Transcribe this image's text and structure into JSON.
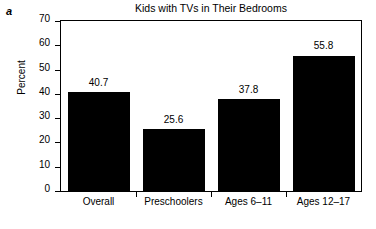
{
  "panel": {
    "letter": "a"
  },
  "chart_data": {
    "type": "bar",
    "title": "Kids with TVs in Their Bedrooms",
    "xlabel": "",
    "ylabel": "Percent",
    "ylim": [
      0,
      70
    ],
    "yticks": [
      0,
      10,
      20,
      30,
      40,
      50,
      60,
      70
    ],
    "ytick_labels": [
      "0",
      "10",
      "20",
      "30",
      "40",
      "50",
      "60",
      "70"
    ],
    "grid": false,
    "legend": null,
    "bar_color": "#000000",
    "categories": [
      "Overall",
      "Preschoolers",
      "Ages 6–11",
      "Ages 12–17"
    ],
    "values": [
      40.7,
      25.6,
      37.8,
      55.8
    ],
    "value_labels": [
      "40.7",
      "25.6",
      "37.8",
      "55.8"
    ]
  }
}
